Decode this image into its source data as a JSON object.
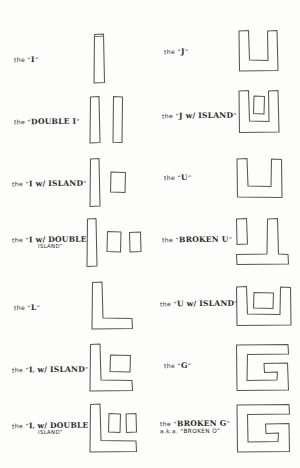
{
  "sheet": {
    "title": "Hand-drawn building massing typology sheet",
    "ink_color": "#55565a",
    "paper_color": "#fdfdfb"
  },
  "left_column": [
    {
      "id": "i",
      "pre": "the ",
      "quote_open": "“",
      "letter": "I",
      "quote_close": "”",
      "label": "the “I”",
      "line2": "",
      "aka": "",
      "figure": "single-vertical-bar"
    },
    {
      "id": "double-i",
      "pre": "the ",
      "quote_open": "“",
      "letter": "DOUBLE I",
      "quote_close": "”",
      "label": "the “DOUBLE I”",
      "line2": "",
      "aka": "",
      "figure": "two-vertical-bars"
    },
    {
      "id": "i-w-island",
      "pre": "the ",
      "quote_open": "“",
      "letter": "I w/ ISLAND",
      "quote_close": "”",
      "label": "the “I w/ ISLAND”",
      "line2": "",
      "aka": "",
      "figure": "bar-plus-one-island"
    },
    {
      "id": "i-w-double-island",
      "pre": "the ",
      "quote_open": "“",
      "letter": "I w/ DOUBLE",
      "quote_close": "”",
      "label": "the “I w/ DOUBLE",
      "line2": "ISLAND”",
      "aka": "",
      "figure": "bar-plus-two-islands"
    },
    {
      "id": "l",
      "pre": "the ",
      "quote_open": "“",
      "letter": "L",
      "quote_close": "”",
      "label": "the “L”",
      "line2": "",
      "aka": "",
      "figure": "l-shape"
    },
    {
      "id": "l-w-island",
      "pre": "the ",
      "quote_open": "“",
      "letter": "L w/ ISLAND",
      "quote_close": "”",
      "label": "the “L w/ ISLAND”",
      "line2": "",
      "aka": "",
      "figure": "l-plus-one-island"
    },
    {
      "id": "l-w-double-island",
      "pre": "the ",
      "quote_open": "“",
      "letter": "L w/ DOUBLE",
      "quote_close": "”",
      "label": "the “L w/ DOUBLE",
      "line2": "ISLAND”",
      "aka": "",
      "figure": "l-plus-two-islands"
    }
  ],
  "right_column": [
    {
      "id": "j",
      "pre": "the ",
      "quote_open": "“",
      "letter": "J",
      "quote_close": "”",
      "label": "the “J”",
      "line2": "",
      "aka": "",
      "figure": "j-shape"
    },
    {
      "id": "j-w-island",
      "pre": "the ",
      "quote_open": "“",
      "letter": "J w/ ISLAND",
      "quote_close": "”",
      "label": "the “J w/ ISLAND”",
      "line2": "",
      "aka": "",
      "figure": "j-plus-island"
    },
    {
      "id": "u",
      "pre": "the ",
      "quote_open": "“",
      "letter": "U",
      "quote_close": "”",
      "label": "the “U”",
      "line2": "",
      "aka": "",
      "figure": "u-shape"
    },
    {
      "id": "broken-u",
      "pre": "the ",
      "quote_open": "“",
      "letter": "BROKEN U",
      "quote_close": "”",
      "label": "the “BROKEN U”",
      "line2": "",
      "aka": "",
      "figure": "broken-u-shape"
    },
    {
      "id": "u-w-island",
      "pre": "the ",
      "quote_open": "“",
      "letter": "U w/ ISLAND",
      "quote_close": "”",
      "label": "the “U w/ ISLAND”",
      "line2": "",
      "aka": "",
      "figure": "u-plus-island"
    },
    {
      "id": "g",
      "pre": "the ",
      "quote_open": "“",
      "letter": "G",
      "quote_close": "”",
      "label": "the “G”",
      "line2": "",
      "aka": "",
      "figure": "g-shape"
    },
    {
      "id": "broken-g",
      "pre": "the ",
      "quote_open": "“",
      "letter": "BROKEN G",
      "quote_close": "”",
      "label": "the “BROKEN G”",
      "line2": "",
      "aka": "a.k.a. “BROKEN O”",
      "figure": "broken-g-shape"
    }
  ]
}
